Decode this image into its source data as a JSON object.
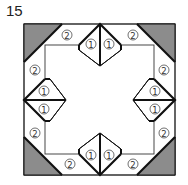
{
  "figure": {
    "number": "15",
    "type": "quilt-block-diagram",
    "colors": {
      "corner_fill": "#8c8c8c",
      "line": "#111111",
      "background": "#ffffff"
    },
    "labels": {
      "edge_piece": "②",
      "diamond_piece": "①"
    },
    "corners": [
      "top-left",
      "top-right",
      "bottom-right",
      "bottom-left"
    ],
    "edge_diamonds": [
      "top",
      "right",
      "bottom",
      "left"
    ],
    "piece_counts": {
      "label_1_count": 8,
      "label_2_count": 8,
      "gray_corner_triangles": 4
    }
  }
}
